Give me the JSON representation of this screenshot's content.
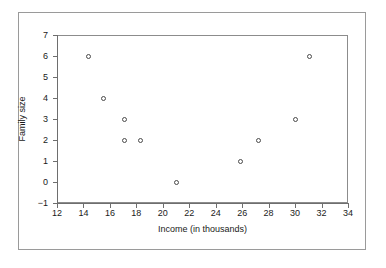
{
  "chart_data": {
    "type": "scatter",
    "title": "",
    "xlabel": "Income (in thousands)",
    "ylabel": "Family size",
    "xlim": [
      12,
      34
    ],
    "ylim": [
      -1,
      7
    ],
    "xticks": [
      12,
      14,
      16,
      18,
      20,
      22,
      24,
      26,
      28,
      30,
      32,
      34
    ],
    "yticks": [
      -1,
      0,
      1,
      2,
      3,
      4,
      5,
      6,
      7
    ],
    "xtick_labels": [
      "12",
      "14",
      "16",
      "18",
      "20",
      "22",
      "24",
      "26",
      "28",
      "30",
      "32",
      "34"
    ],
    "ytick_labels": [
      "−1",
      "0",
      "1",
      "2",
      "3",
      "4",
      "5",
      "6",
      "7"
    ],
    "grid": false,
    "legend": null,
    "marker": "open-circle",
    "marker_color": "#4a4a4a",
    "points": [
      {
        "x": 14.4,
        "y": 6
      },
      {
        "x": 15.5,
        "y": 4
      },
      {
        "x": 17.1,
        "y": 3
      },
      {
        "x": 17.1,
        "y": 2
      },
      {
        "x": 18.3,
        "y": 2
      },
      {
        "x": 21.0,
        "y": 0
      },
      {
        "x": 25.9,
        "y": 1
      },
      {
        "x": 27.2,
        "y": 2
      },
      {
        "x": 30.0,
        "y": 3
      },
      {
        "x": 31.1,
        "y": 6
      }
    ]
  },
  "colors": {
    "background": "#ffffff",
    "frame": "#9a9a9a",
    "axis": "#6e6e6e",
    "text": "#1a1a1a"
  }
}
